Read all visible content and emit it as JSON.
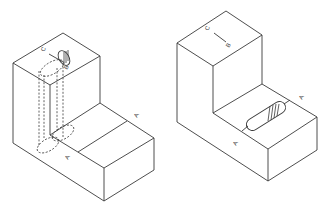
{
  "figures": [
    {
      "id": "left",
      "description": "Isometric L-block with hidden vertical cylindrical hole",
      "labels": [
        {
          "text": "C",
          "x": 44,
          "y": 52,
          "rot": -60
        },
        {
          "text": "B",
          "x": 67,
          "y": 70,
          "rot": -60
        },
        {
          "text": "A",
          "x": 137,
          "y": 118,
          "rot": -60
        },
        {
          "text": "A",
          "x": 68,
          "y": 160,
          "rot": -60
        }
      ]
    },
    {
      "id": "right",
      "description": "Isometric L-block with horizontal slot on lower step",
      "labels": [
        {
          "text": "C",
          "x": 208,
          "y": 31,
          "rot": -60
        },
        {
          "text": "B",
          "x": 229,
          "y": 48,
          "rot": -60
        },
        {
          "text": "A",
          "x": 302,
          "y": 100,
          "rot": -60
        },
        {
          "text": "A",
          "x": 236,
          "y": 146,
          "rot": -60
        }
      ]
    }
  ],
  "colors": {
    "line": "#3a3a3a",
    "background": "#ffffff"
  }
}
